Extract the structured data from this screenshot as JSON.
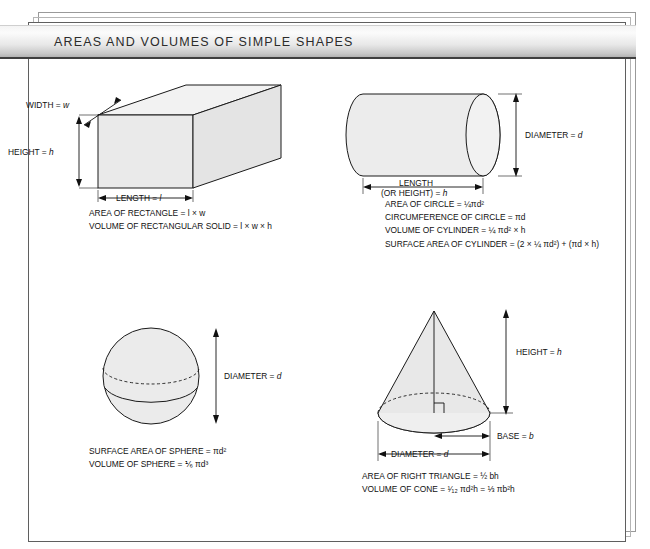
{
  "header": {
    "title": "AREAS AND VOLUMES OF SIMPLE SHAPES"
  },
  "shapes": {
    "box": {
      "name": "rectangular-solid",
      "labels": {
        "width": "WIDTH = ",
        "width_var": "w",
        "height": "HEIGHT = ",
        "height_var": "h",
        "length": "LENGTH = ",
        "length_var": "l"
      },
      "formulas": [
        "AREA OF RECTANGLE = l × w",
        "VOLUME OF RECTANGULAR SOLID = l × w × h"
      ]
    },
    "cylinder": {
      "name": "cylinder",
      "labels": {
        "diameter": "DIAMETER = ",
        "diameter_var": "d",
        "length_line1": "LENGTH",
        "length_line2": "(OR HEIGHT) = ",
        "length_var": "h"
      },
      "formulas": [
        "AREA OF CIRCLE = ¼πd²",
        "CIRCUMFERENCE OF CIRCLE = πd",
        "VOLUME OF CYLINDER = ¼ πd² × h",
        "SURFACE AREA OF CYLINDER = (2 × ¼ πd²) + (πd × h)"
      ]
    },
    "sphere": {
      "name": "sphere",
      "labels": {
        "diameter": "DIAMETER = ",
        "diameter_var": "d"
      },
      "formulas": [
        "SURFACE AREA OF SPHERE = πd²",
        "VOLUME OF SPHERE = ⅙ πd³"
      ]
    },
    "cone": {
      "name": "cone",
      "labels": {
        "height": "HEIGHT = ",
        "height_var": "h",
        "base": "BASE = ",
        "base_var": "b",
        "diameter": "DIAMETER = ",
        "diameter_var": "d"
      },
      "formulas": [
        "AREA OF RIGHT TRIANGLE = ½ bh",
        "VOLUME OF CONE = ¹⁄₁₂ πd²h = ⅓ πb²h"
      ]
    }
  },
  "colors": {
    "shape_fill": "#e9e9e9",
    "shape_fill_light": "#f1f1f1",
    "stroke": "#1a1a1a",
    "banner_dark": "#b3b3b3",
    "banner_light": "#f4f4f4"
  }
}
